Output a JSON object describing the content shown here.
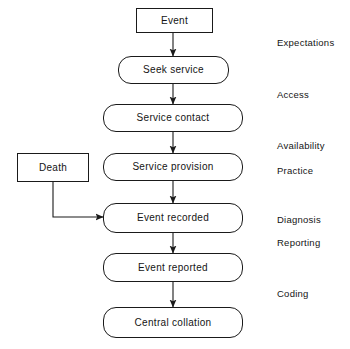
{
  "diagram": {
    "type": "flowchart",
    "stroke_color": "#1a1a1a",
    "background_color": "#ffffff",
    "nodes": [
      {
        "id": "event",
        "label": "Event",
        "shape": "rectangle",
        "x": 136,
        "y": 8,
        "w": 77,
        "h": 25
      },
      {
        "id": "seek-service",
        "label": "Seek service",
        "shape": "rounded-rect",
        "x": 118,
        "y": 56,
        "w": 111,
        "h": 28
      },
      {
        "id": "service-contact",
        "label": "Service contact",
        "shape": "rounded-rect",
        "x": 103,
        "y": 104,
        "w": 140,
        "h": 28
      },
      {
        "id": "service-provision",
        "label": "Service provision",
        "shape": "rounded-rect",
        "x": 103,
        "y": 153,
        "w": 140,
        "h": 28
      },
      {
        "id": "death",
        "label": "Death",
        "shape": "rectangle",
        "x": 17,
        "y": 153,
        "w": 72,
        "h": 29
      },
      {
        "id": "event-recorded",
        "label": "Event recorded",
        "shape": "rounded-rect",
        "x": 103,
        "y": 203,
        "w": 140,
        "h": 30
      },
      {
        "id": "event-reported",
        "label": "Event reported",
        "shape": "rounded-rect",
        "x": 103,
        "y": 253,
        "w": 140,
        "h": 29
      },
      {
        "id": "central-collation",
        "label": "Central collation",
        "shape": "rounded-rect",
        "x": 103,
        "y": 307,
        "w": 140,
        "h": 31
      }
    ],
    "connectors": [
      {
        "id": "event-to-seek-service",
        "from": "event",
        "to": "seek-service",
        "style": "straight-down-arrow"
      },
      {
        "id": "seek-service-to-service-contact",
        "from": "seek-service",
        "to": "service-contact",
        "style": "straight-down-arrow"
      },
      {
        "id": "service-contact-to-service-provision",
        "from": "service-contact",
        "to": "service-provision",
        "style": "straight-down-arrow"
      },
      {
        "id": "service-provision-to-event-recorded",
        "from": "service-provision",
        "to": "event-recorded",
        "style": "straight-down-arrow"
      },
      {
        "id": "death-to-event-recorded",
        "from": "death",
        "to": "event-recorded",
        "style": "elbow-right-arrow"
      },
      {
        "id": "event-recorded-to-event-reported",
        "from": "event-recorded",
        "to": "event-reported",
        "style": "straight-down-arrow"
      },
      {
        "id": "event-reported-to-central-collation",
        "from": "event-reported",
        "to": "central-collation",
        "style": "straight-down-arrow"
      }
    ],
    "stage_labels": [
      {
        "id": "expectations",
        "label": "Expectations",
        "x": 277,
        "y": 38
      },
      {
        "id": "access",
        "label": "Access",
        "x": 277,
        "y": 90
      },
      {
        "id": "availability",
        "label": "Availability",
        "x": 277,
        "y": 141
      },
      {
        "id": "practice",
        "label": "Practice",
        "x": 277,
        "y": 166
      },
      {
        "id": "diagnosis",
        "label": "Diagnosis",
        "x": 277,
        "y": 215
      },
      {
        "id": "reporting",
        "label": "Reporting",
        "x": 277,
        "y": 238
      },
      {
        "id": "coding",
        "label": "Coding",
        "x": 277,
        "y": 289
      }
    ]
  }
}
